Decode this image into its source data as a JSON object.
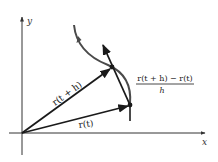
{
  "diagram": {
    "axes": {
      "x_label": "x",
      "y_label": "y"
    },
    "vectors": {
      "r_t_label": "r(t)",
      "r_t_plus_h_label": "r(t + h)"
    },
    "difference_quotient": {
      "numerator": "r(t + h) − r(t)",
      "denominator": "h"
    },
    "colors": {
      "vector": "#1a1a1a",
      "curve": "#4a4a4a",
      "axis": "#333333",
      "background": "#ffffff"
    }
  }
}
